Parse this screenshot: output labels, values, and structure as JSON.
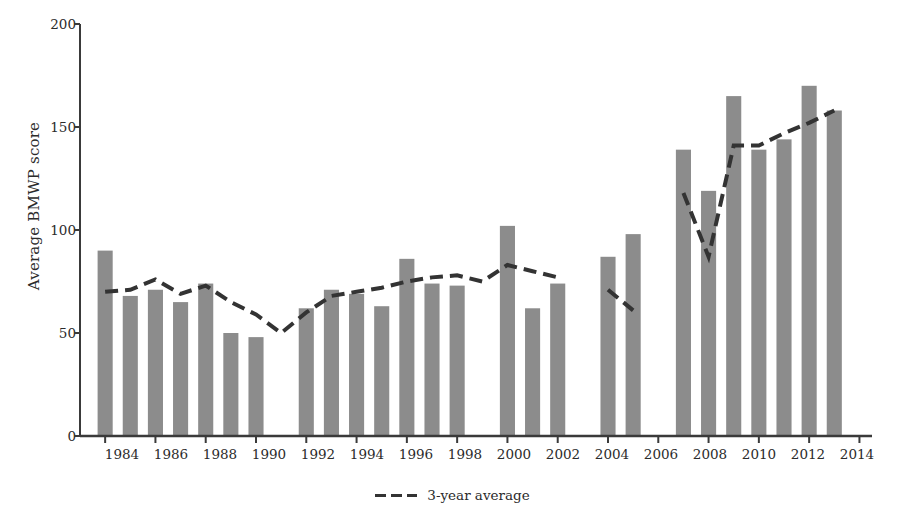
{
  "chart_data": {
    "type": "bar",
    "title": "",
    "xlabel": "",
    "ylabel": "Average BMWP score",
    "ylim": [
      0,
      200
    ],
    "xlim": [
      1983,
      2014.5
    ],
    "yticks": [
      0,
      50,
      100,
      150,
      200
    ],
    "xticks": [
      1984,
      1986,
      1988,
      1990,
      1992,
      1994,
      1996,
      1998,
      2000,
      2002,
      2004,
      2006,
      2008,
      2010,
      2012,
      2014
    ],
    "grid": false,
    "legend_position": "bottom-center",
    "categories": [
      1984,
      1985,
      1986,
      1987,
      1988,
      1989,
      1990,
      1991,
      1992,
      1993,
      1994,
      1995,
      1996,
      1997,
      1998,
      1999,
      2000,
      2001,
      2002,
      2004,
      2005,
      2007,
      2008,
      2009,
      2010,
      2011,
      2012,
      2013
    ],
    "series": [
      {
        "name": "Average BMWP score",
        "type": "bar",
        "color": "#8c8c8c",
        "values": [
          90,
          68,
          71,
          65,
          74,
          50,
          48,
          null,
          62,
          71,
          69,
          63,
          86,
          74,
          73,
          null,
          102,
          62,
          74,
          87,
          98,
          139,
          119,
          165,
          139,
          144,
          170,
          158
        ]
      },
      {
        "name": "3-year average",
        "type": "line",
        "color": "#333333",
        "style": "dashed",
        "x": [
          1984,
          1985,
          1986,
          1987,
          1988,
          1989,
          1990,
          1991,
          1992,
          1993,
          1994,
          1995,
          1996,
          1997,
          1998,
          1999,
          2000,
          2001,
          2002,
          2004,
          2005,
          2007,
          2008,
          2009,
          2010,
          2011,
          2012,
          2013
        ],
        "values": [
          70,
          71,
          76,
          69,
          73,
          65,
          59,
          50,
          60,
          68,
          70,
          72,
          75,
          77,
          78,
          75,
          83,
          80,
          77,
          71,
          61,
          118,
          87,
          141,
          141,
          147,
          152,
          158
        ]
      }
    ],
    "legend": [
      "3-year average"
    ],
    "missing_years": [
      2003,
      2006
    ]
  },
  "axis": {
    "y_tick_labels": [
      "0",
      "50",
      "100",
      "150",
      "200"
    ],
    "x_tick_labels": [
      "1984",
      "1986",
      "1988",
      "1990",
      "1992",
      "1994",
      "1996",
      "1998",
      "2000",
      "2002",
      "2004",
      "2006",
      "2008",
      "2010",
      "2012",
      "2014"
    ]
  },
  "legend": {
    "series_label": "3-year average"
  },
  "style": {
    "bar_color": "#8c8c8c",
    "line_color": "#333333",
    "axis_color": "#3a3a3a",
    "text_color": "#2b2b2b",
    "background": "#ffffff"
  }
}
